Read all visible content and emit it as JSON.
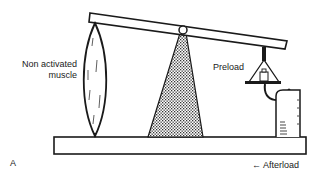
{
  "figure": {
    "panel_letter": "A"
  },
  "labels": {
    "muscle_line1": "Non activated",
    "muscle_line2": "muscle",
    "preload": "Preload",
    "afterload": "← Afterload"
  },
  "components": [
    {
      "name": "lever-beam",
      "description": "tilted lever bar"
    },
    {
      "name": "fulcrum",
      "description": "pivot on stippled triangular stand"
    },
    {
      "name": "muscle",
      "description": "spindle-shaped non activated muscle attached between lever and base"
    },
    {
      "name": "preload-weight",
      "description": "weight pan hanging from lever end"
    },
    {
      "name": "afterload-block",
      "description": "support block under weight pan"
    },
    {
      "name": "base-platform",
      "description": "horizontal base board"
    }
  ],
  "colors": {
    "ink": "#1a1a1a",
    "background": "#ffffff",
    "stipple": "#555555"
  }
}
